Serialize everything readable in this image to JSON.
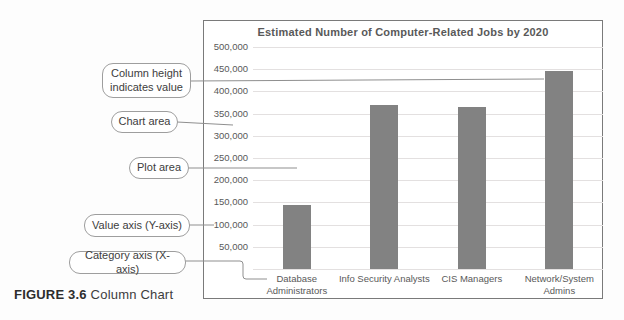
{
  "figure": {
    "caption_label": "FIGURE 3.6",
    "caption_text": "Column Chart"
  },
  "callouts": [
    {
      "id": "column-height",
      "label": "Column height indicates value"
    },
    {
      "id": "chart-area",
      "label": "Chart area"
    },
    {
      "id": "plot-area",
      "label": "Plot area"
    },
    {
      "id": "value-axis",
      "label": "Value axis (Y-axis)"
    },
    {
      "id": "category-axis",
      "label": "Category axis (X-axis)"
    }
  ],
  "chart_data": {
    "type": "bar",
    "title": "Estimated Number of Computer-Related Jobs by 2020",
    "categories": [
      "Database Administrators",
      "Info Security Analysts",
      "CIS Managers",
      "Network/System Admins"
    ],
    "xtick_labels": [
      "Database\nAdministrators",
      "Info Security Analysts",
      "CIS Managers",
      "Network/System\nAdmins"
    ],
    "values": [
      145000,
      370000,
      365000,
      445000
    ],
    "xlabel": "",
    "ylabel": "",
    "ylim": [
      0,
      500000
    ],
    "ytick_interval": 50000,
    "grid": true,
    "legend": false,
    "bar_color": "#828282",
    "gridline_color": "#e3e0e0",
    "text_color": "#595959"
  }
}
